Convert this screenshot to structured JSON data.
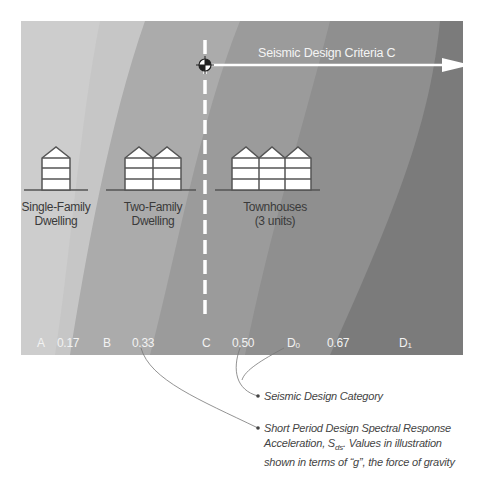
{
  "diagram": {
    "title": "Seismic Design Criteria C",
    "colors": {
      "band_A": "#cfcfcf",
      "band_B": "#b8b8b8",
      "band_C": "#a3a3a3",
      "band_D0": "#8f8f8f",
      "band_D1": "#7b7b7b",
      "marker_line": "#ffffff",
      "text_dark": "#3a3a3a",
      "text_light": "#f2f2f2"
    },
    "buildings": [
      {
        "label_line1": "Single-Family",
        "label_line2": "Dwelling",
        "units": 1
      },
      {
        "label_line1": "Two-Family",
        "label_line2": "Dwelling",
        "units": 2
      },
      {
        "label_line1": "Townhouses",
        "label_line2": "(3 units)",
        "units": 3
      }
    ],
    "axis": {
      "categories": [
        {
          "label": "A"
        },
        {
          "label": "B"
        },
        {
          "label": "C"
        },
        {
          "label": "D",
          "sub": "0"
        },
        {
          "label": "D",
          "sub": "1"
        }
      ],
      "values": [
        "0.17",
        "0.33",
        "0.50",
        "0.67"
      ]
    },
    "legend": {
      "item1": "Seismic Design Category",
      "item2_line1": "Short Period Design Spectral Response",
      "item2_line2_pre": "Acceleration, S",
      "item2_line2_sub": "ds",
      "item2_line2_post": ". Values in illustration",
      "item2_line3": "shown in terms of “g”, the force of gravity"
    },
    "icons": {
      "target_marker": "crosshair-target-icon",
      "arrow": "arrow-right-icon"
    }
  }
}
